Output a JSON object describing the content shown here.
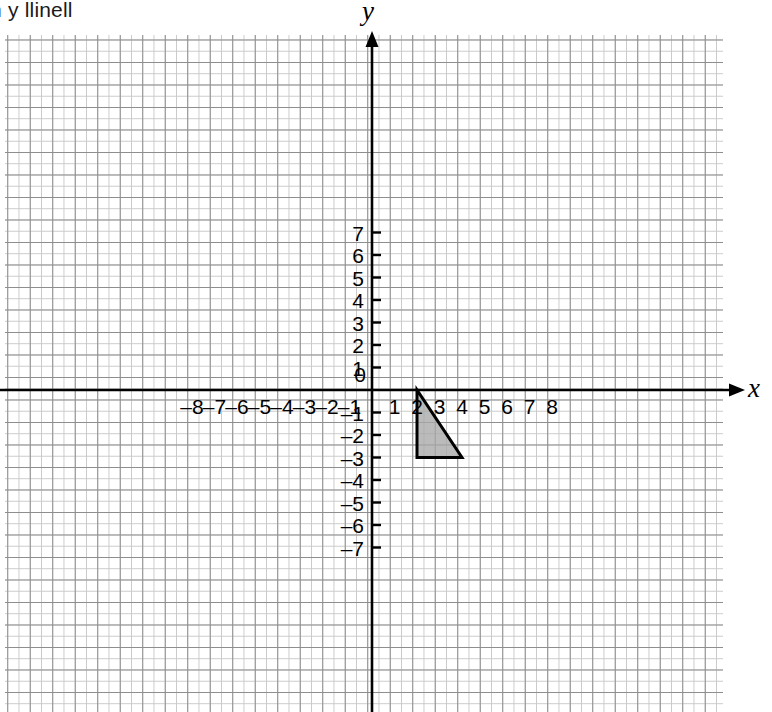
{
  "caption": {
    "text": "n y llinell"
  },
  "chart_data": {
    "type": "scatter",
    "title": "",
    "xlabel": "x",
    "ylabel": "y",
    "xlim": [
      -8.3,
      15.6
    ],
    "ylim": [
      -7.9,
      7.9
    ],
    "grid": true,
    "grid_minor_step": 0.5,
    "grid_major_step": 1,
    "legend": "none",
    "x_tick_labels": [
      "–8",
      "–7",
      "–6",
      "–5",
      "–4",
      "–3",
      "–2",
      "–1",
      "1",
      "2",
      "3",
      "4",
      "5",
      "6",
      "7",
      "8"
    ],
    "x_tick_values": [
      -8,
      -7,
      -6,
      -5,
      -4,
      -3,
      -2,
      -1,
      1,
      2,
      3,
      4,
      5,
      6,
      7,
      8
    ],
    "y_tick_labels": [
      "7",
      "6",
      "5",
      "4",
      "3",
      "2",
      "1",
      "–1",
      "–2",
      "–3",
      "–4",
      "–5",
      "–6",
      "–7"
    ],
    "y_tick_values": [
      7,
      6,
      5,
      4,
      3,
      2,
      1,
      -1,
      -2,
      -3,
      -4,
      -5,
      -6,
      -7
    ],
    "origin_label": "0",
    "shapes": [
      {
        "name": "shaded-triangle",
        "type": "polygon",
        "vertices": [
          [
            2,
            0
          ],
          [
            2,
            -3
          ],
          [
            4,
            -3
          ]
        ],
        "fill": "#a8a8a8",
        "stroke": "#000000",
        "stroke_width": 3
      }
    ],
    "axis_color": "#000000",
    "grid_minor_color": "#c9c9c9",
    "grid_major_color": "#8d8d8d"
  }
}
